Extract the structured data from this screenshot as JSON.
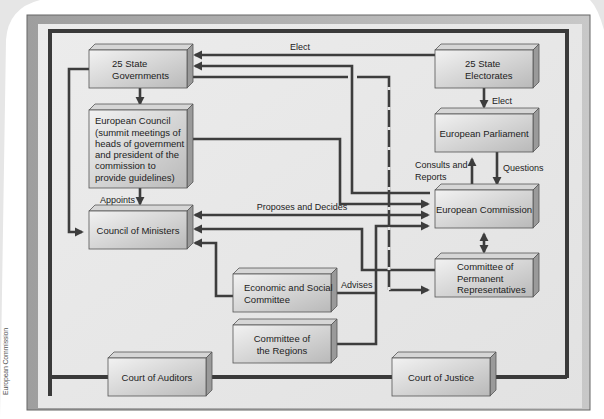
{
  "credit": "European Commission",
  "boxes": {
    "state_governments": {
      "lines": [
        "25 State",
        "Governments"
      ]
    },
    "european_council": {
      "lines": [
        "European Council",
        "(summit meetings of",
        "heads of government",
        "and president of the",
        "commission to",
        "provide guidelines)"
      ]
    },
    "council_of_ministers": {
      "lines": [
        "Council of Ministers"
      ]
    },
    "state_electorates": {
      "lines": [
        "25 State",
        "Electorates"
      ]
    },
    "european_parliament": {
      "lines": [
        "European Parliament"
      ]
    },
    "european_commission": {
      "lines": [
        "European Commission"
      ]
    },
    "permanent_representatives": {
      "lines": [
        "Committee of",
        "Permanent",
        "Representatives"
      ]
    },
    "economic_social_committee": {
      "lines": [
        "Economic and Social",
        "Committee"
      ]
    },
    "committee_of_regions": {
      "lines": [
        "Committee of",
        "the Regions"
      ]
    },
    "court_of_auditors": {
      "lines": [
        "Court of Auditors"
      ]
    },
    "court_of_justice": {
      "lines": [
        "Court of Justice"
      ]
    }
  },
  "edge_labels": {
    "elect_top": "Elect",
    "elect_parliament": "Elect",
    "appoints": "Appoints",
    "proposes_decides": "Proposes and Decides",
    "consults_reports_1": "Consults and",
    "consults_reports_2": "Reports",
    "questions": "Questions",
    "advises": "Advises"
  },
  "colors": {
    "frame_outer": "#a9a9a9",
    "frame_inner_bg": "#e9e9e9",
    "border_dark": "#3a3a3a",
    "line": "#3d3d3d",
    "box_face_top": "#efefef",
    "box_face_bottom": "#bdbdbd"
  }
}
